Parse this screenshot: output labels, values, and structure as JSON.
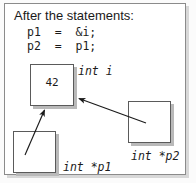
{
  "figure": {
    "caption_lines": [
      "After the statements:"
    ],
    "code": [
      "p1  =  &i;",
      "p2  =  p1;"
    ],
    "boxes": [
      {
        "id": "i",
        "value": "42",
        "label": "int i"
      },
      {
        "id": "p1",
        "value": "",
        "label": "int *p1"
      },
      {
        "id": "p2",
        "value": "",
        "label": "int *p2"
      }
    ],
    "arrows": [
      {
        "from": "p1",
        "to": "i"
      },
      {
        "from": "p2",
        "to": "i"
      }
    ],
    "colors": {
      "frame_border": "#8b8b8b",
      "box_border": "#5a5a5a",
      "shadow": "#b9b9b9",
      "text": "#1a1a1a",
      "background": "#ffffff"
    }
  }
}
